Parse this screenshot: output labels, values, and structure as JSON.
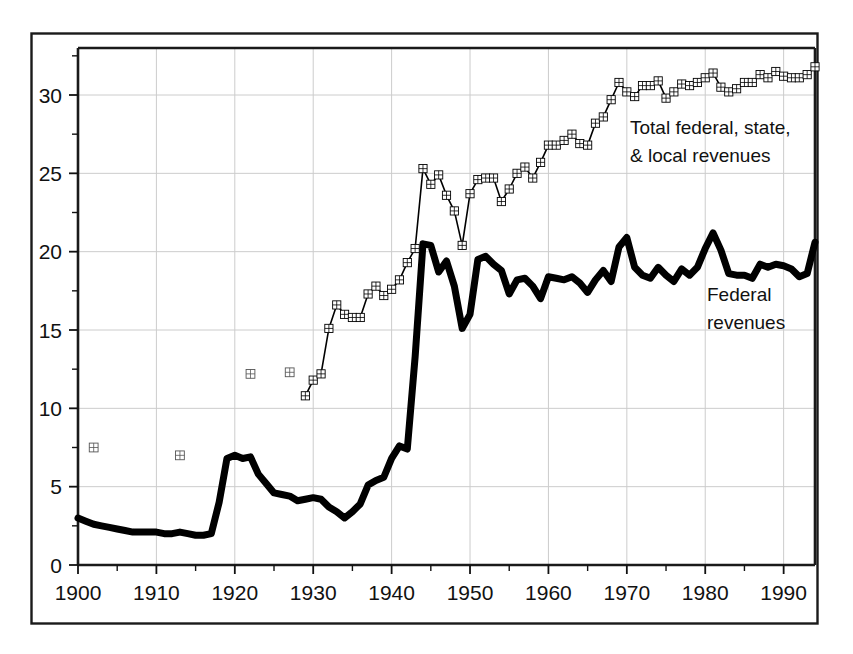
{
  "chart_data": {
    "type": "line",
    "title": "",
    "subtitle": "",
    "xlabel": "",
    "ylabel": "",
    "xlim": [
      1900,
      1994
    ],
    "ylim": [
      0,
      33
    ],
    "grid": true,
    "legend_position": "inline-annotations",
    "x_ticks": [
      1900,
      1910,
      1920,
      1930,
      1940,
      1950,
      1960,
      1970,
      1980,
      1990
    ],
    "x_tick_labels": [
      "1900",
      "1910",
      "1920",
      "1930",
      "1940",
      "1950",
      "1960",
      "1970",
      "1980",
      "1990"
    ],
    "x_minor_tick_interval": 5,
    "y_ticks": [
      0,
      5,
      10,
      15,
      20,
      25,
      30
    ],
    "y_tick_labels": [
      "0",
      "5",
      "10",
      "15",
      "20",
      "25",
      "30"
    ],
    "y_minor_tick_interval": 2.5,
    "series": [
      {
        "name": "Total federal, state, & local revenues",
        "annotation": "Total federal, state,\n& local revenues",
        "annotation_line1": "Total federal, state,",
        "annotation_line2": "& local revenues",
        "style": "thin-line-with-square-markers",
        "marker": "square-with-cross",
        "color": "#000000",
        "line_width": 1.6,
        "isolated_points": [
          {
            "x": 1902,
            "y": 7.5
          },
          {
            "x": 1913,
            "y": 7.0
          },
          {
            "x": 1922,
            "y": 12.2
          },
          {
            "x": 1927,
            "y": 12.3
          }
        ],
        "x": [
          1929,
          1930,
          1931,
          1932,
          1933,
          1934,
          1935,
          1936,
          1937,
          1938,
          1939,
          1940,
          1941,
          1942,
          1943,
          1944,
          1945,
          1946,
          1947,
          1948,
          1949,
          1950,
          1951,
          1952,
          1953,
          1954,
          1955,
          1956,
          1957,
          1958,
          1959,
          1960,
          1961,
          1962,
          1963,
          1964,
          1965,
          1966,
          1967,
          1968,
          1969,
          1970,
          1971,
          1972,
          1973,
          1974,
          1975,
          1976,
          1977,
          1978,
          1979,
          1980,
          1981,
          1982,
          1983,
          1984,
          1985,
          1986,
          1987,
          1988,
          1989,
          1990,
          1991,
          1992,
          1993,
          1994
        ],
        "y": [
          10.8,
          11.8,
          12.2,
          15.1,
          16.6,
          16.0,
          15.8,
          15.8,
          17.3,
          17.8,
          17.2,
          17.6,
          18.2,
          19.3,
          20.2,
          25.3,
          24.3,
          24.9,
          23.6,
          22.6,
          20.4,
          23.7,
          24.6,
          24.7,
          24.7,
          23.2,
          24.0,
          25.0,
          25.4,
          24.7,
          25.7,
          26.8,
          26.8,
          27.1,
          27.5,
          26.9,
          26.8,
          28.2,
          28.6,
          29.7,
          30.8,
          30.2,
          29.9,
          30.6,
          30.6,
          30.9,
          29.8,
          30.2,
          30.7,
          30.6,
          30.8,
          31.1,
          31.4,
          30.5,
          30.2,
          30.4,
          30.8,
          30.8,
          31.3,
          31.1,
          31.5,
          31.2,
          31.1,
          31.1,
          31.3,
          31.8
        ]
      },
      {
        "name": "Federal revenues",
        "annotation": "Federal\nrevenues",
        "annotation_line1": "Federal",
        "annotation_line2": "revenues",
        "style": "thick-line",
        "marker": "none",
        "color": "#000000",
        "line_width": 7,
        "x": [
          1900,
          1901,
          1902,
          1903,
          1904,
          1905,
          1906,
          1907,
          1908,
          1909,
          1910,
          1911,
          1912,
          1913,
          1914,
          1915,
          1916,
          1917,
          1918,
          1919,
          1920,
          1921,
          1922,
          1923,
          1924,
          1925,
          1926,
          1927,
          1928,
          1929,
          1930,
          1931,
          1932,
          1933,
          1934,
          1935,
          1936,
          1937,
          1938,
          1939,
          1940,
          1941,
          1942,
          1943,
          1944,
          1945,
          1946,
          1947,
          1948,
          1949,
          1950,
          1951,
          1952,
          1953,
          1954,
          1955,
          1956,
          1957,
          1958,
          1959,
          1960,
          1961,
          1962,
          1963,
          1964,
          1965,
          1966,
          1967,
          1968,
          1969,
          1970,
          1971,
          1972,
          1973,
          1974,
          1975,
          1976,
          1977,
          1978,
          1979,
          1980,
          1981,
          1982,
          1983,
          1984,
          1985,
          1986,
          1987,
          1988,
          1989,
          1990,
          1991,
          1992,
          1993,
          1994
        ],
        "y": [
          3.0,
          2.8,
          2.6,
          2.5,
          2.4,
          2.3,
          2.2,
          2.1,
          2.1,
          2.1,
          2.1,
          2.0,
          2.0,
          2.1,
          2.0,
          1.9,
          1.9,
          2.0,
          4.0,
          6.8,
          7.0,
          6.8,
          6.9,
          5.8,
          5.2,
          4.6,
          4.5,
          4.4,
          4.1,
          4.2,
          4.3,
          4.2,
          3.7,
          3.4,
          3.0,
          3.4,
          3.9,
          5.1,
          5.4,
          5.6,
          6.8,
          7.6,
          7.4,
          13.3,
          20.5,
          20.4,
          18.7,
          19.4,
          17.8,
          15.1,
          16.0,
          19.5,
          19.7,
          19.2,
          18.8,
          17.3,
          18.2,
          18.3,
          17.8,
          17.0,
          18.4,
          18.3,
          18.2,
          18.4,
          18.0,
          17.4,
          18.2,
          18.8,
          18.1,
          20.3,
          20.9,
          19.0,
          18.5,
          18.3,
          19.0,
          18.5,
          18.1,
          18.9,
          18.5,
          19.0,
          20.2,
          21.2,
          20.1,
          18.6,
          18.5,
          18.5,
          18.3,
          19.2,
          19.0,
          19.2,
          19.1,
          18.9,
          18.4,
          18.6,
          20.6
        ]
      }
    ]
  },
  "annotations": {
    "total_label_line1": "Total federal, state,",
    "total_label_line2": "& local revenues",
    "federal_label_line1": "Federal",
    "federal_label_line2": "revenues"
  },
  "axes": {
    "x_tick_labels": [
      "1900",
      "1910",
      "1920",
      "1930",
      "1940",
      "1950",
      "1960",
      "1970",
      "1980",
      "1990"
    ],
    "y_tick_labels": [
      "0",
      "5",
      "10",
      "15",
      "20",
      "25",
      "30"
    ]
  },
  "colors": {
    "line": "#000000",
    "grid": "#cccccc",
    "frame": "#111111",
    "background": "#ffffff"
  }
}
